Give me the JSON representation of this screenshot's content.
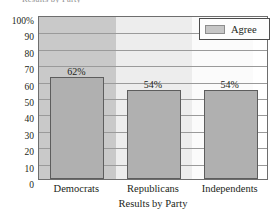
{
  "chart_data": {
    "type": "bar",
    "title": "",
    "xlabel": "Results by Party",
    "ylabel": "",
    "categories": [
      "Democrats",
      "Republicans",
      "Independents"
    ],
    "values": [
      62,
      54,
      54
    ],
    "data_labels": [
      "62%",
      "54%",
      "54%"
    ],
    "series": [
      {
        "name": "Agree",
        "values": [
          62,
          54,
          54
        ]
      }
    ],
    "ylim": [
      0,
      100
    ],
    "ytick_labels": [
      "100%",
      "90",
      "80",
      "70",
      "60",
      "50",
      "40",
      "30",
      "20",
      "10",
      "0"
    ],
    "ytick_values": [
      100,
      90,
      80,
      70,
      60,
      50,
      40,
      30,
      20,
      10,
      0
    ],
    "grid": true,
    "legend_position": "top-right",
    "bar_color": "#b0b0b0",
    "bar_border_color": "#5d5d5d",
    "plot_border_color": "#6e6e6e",
    "gridline_color": "#9a9a9a"
  },
  "legend": {
    "entries": [
      {
        "label": "Agree",
        "swatch_color": "#c6c6c6"
      }
    ]
  },
  "axis": {
    "x_title": "Results by Party"
  },
  "clipped_header": {
    "text": "Results by Party"
  }
}
